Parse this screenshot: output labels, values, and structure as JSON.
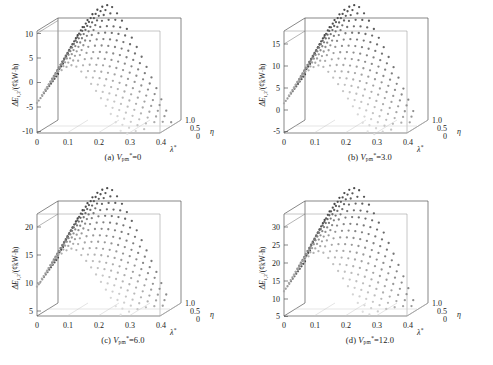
{
  "figure": {
    "title": "",
    "background": "#ffffff",
    "panel_count": 4,
    "layout": "2x2"
  },
  "axis_labels": {
    "z_prefix": "ΔE",
    "z_sub": "1,2",
    "z_unit": "/(€cent·kW·h)",
    "z_unit_text": "/(¢kW·h)",
    "x": "λ",
    "x_sup": "*",
    "y": "η"
  },
  "shared": {
    "x_ticks": [
      "0",
      "0.1",
      "0.2",
      "0.3",
      "0.4"
    ],
    "x_values": [
      0,
      0.1,
      0.2,
      0.3,
      0.4
    ],
    "y_ticks": [
      "0",
      "0.5",
      "1.0"
    ],
    "y_values": [
      0,
      0.5,
      1.0
    ],
    "marker": "dot-mesh",
    "colormap_dark": "#3a3a3a",
    "colormap_light": "#e8e8e8"
  },
  "chart_data": [
    {
      "type": "scatter",
      "id": "a",
      "caption_index": "(a)",
      "caption_param": "V",
      "caption_param_sub": "pm",
      "caption_param_sup": "*",
      "caption_value": "0",
      "caption_full": "(a) V*pm = 0",
      "title": "",
      "xlabel": "λ*",
      "ylabel": "η",
      "zlabel": "ΔE1,2/(¢kW·h)",
      "xlim": [
        0,
        0.4
      ],
      "ylim": [
        0,
        1.0
      ],
      "zlim": [
        -10,
        12
      ],
      "z_ticks": [
        "10",
        "5",
        "0",
        "-5",
        "-10"
      ],
      "z_values": [
        10,
        5,
        0,
        -5,
        -10
      ],
      "grid": true,
      "legend": "none",
      "surface_peak": 12,
      "surface_min": -8
    },
    {
      "type": "scatter",
      "id": "b",
      "caption_index": "(b)",
      "caption_param": "V",
      "caption_param_sub": "pm",
      "caption_param_sup": "*",
      "caption_value": "3.0",
      "caption_full": "(b) V*pm = 3.0",
      "title": "",
      "xlabel": "λ*",
      "ylabel": "η",
      "zlabel": "ΔE1,2/(¢kW·h)",
      "xlim": [
        0,
        0.4
      ],
      "ylim": [
        0,
        1.0
      ],
      "zlim": [
        -5,
        18
      ],
      "z_ticks": [
        "15",
        "10",
        "5",
        "0",
        "-5"
      ],
      "z_values": [
        15,
        10,
        5,
        0,
        -5
      ],
      "grid": true,
      "legend": "none",
      "surface_peak": 18,
      "surface_min": -3
    },
    {
      "type": "scatter",
      "id": "c",
      "caption_index": "(c)",
      "caption_param": "V",
      "caption_param_sub": "pm",
      "caption_param_sup": "*",
      "caption_value": "6.0",
      "caption_full": "(c) V*pm = 6.0",
      "title": "",
      "xlabel": "λ*",
      "ylabel": "η",
      "zlabel": "ΔE1,2/(¢kW·h)",
      "xlim": [
        0,
        0.4
      ],
      "ylim": [
        0,
        1.0
      ],
      "zlim": [
        0,
        24
      ],
      "z_ticks": [
        "20",
        "15",
        "10",
        "5"
      ],
      "z_values": [
        20,
        15,
        10,
        5
      ],
      "grid": true,
      "legend": "none",
      "surface_peak": 24,
      "surface_min": 2
    },
    {
      "type": "scatter",
      "id": "d",
      "caption_index": "(d)",
      "caption_param": "V",
      "caption_param_sub": "pm",
      "caption_param_sup": "*",
      "caption_value": "12.0",
      "caption_full": "(d) V*pm = 12.0",
      "title": "",
      "xlabel": "λ*",
      "ylabel": "η",
      "zlabel": "ΔE1,2/(¢kW·h)",
      "xlim": [
        0,
        0.4
      ],
      "ylim": [
        0,
        1.0
      ],
      "zlim": [
        5,
        34
      ],
      "z_ticks": [
        "30",
        "25",
        "20",
        "15",
        "10",
        "5"
      ],
      "z_values": [
        30,
        25,
        20,
        15,
        10,
        5
      ],
      "grid": true,
      "legend": "none",
      "surface_peak": 34,
      "surface_min": 6
    }
  ]
}
